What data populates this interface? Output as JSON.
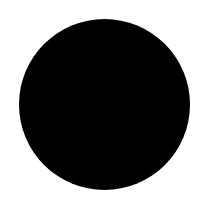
{
  "canvas": {
    "width": 203,
    "height": 208,
    "background_color": "#ffffff"
  },
  "shapes": [
    {
      "type": "circle",
      "fill_color": "#000000",
      "center_x": 104,
      "center_y": 104,
      "diameter": 171
    }
  ]
}
